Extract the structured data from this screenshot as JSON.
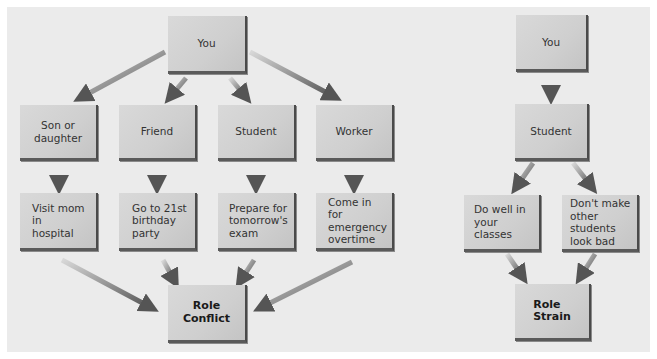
{
  "colors": {
    "panel_background": "#ebebeb",
    "box_fill": "#d4d4d4",
    "box_shadow_edge": "#4a4a4a",
    "arrow": "#6a6a6a"
  },
  "role_conflict": {
    "root": "You",
    "roles": [
      "Son or\ndaughter",
      "Friend",
      "Student",
      "Worker"
    ],
    "expectations": [
      "Visit mom in\nhospital",
      "Go to 21st\nbirthday\nparty",
      "Prepare for\ntomorrow's\nexam",
      "Come in for\nemergency\novertime"
    ],
    "result": "Role Conflict"
  },
  "role_strain": {
    "root": "You",
    "role": "Student",
    "expectations": [
      "Do well in\nyour classes",
      "Don't make\nother students\nlook bad"
    ],
    "result": "Role\nStrain"
  }
}
